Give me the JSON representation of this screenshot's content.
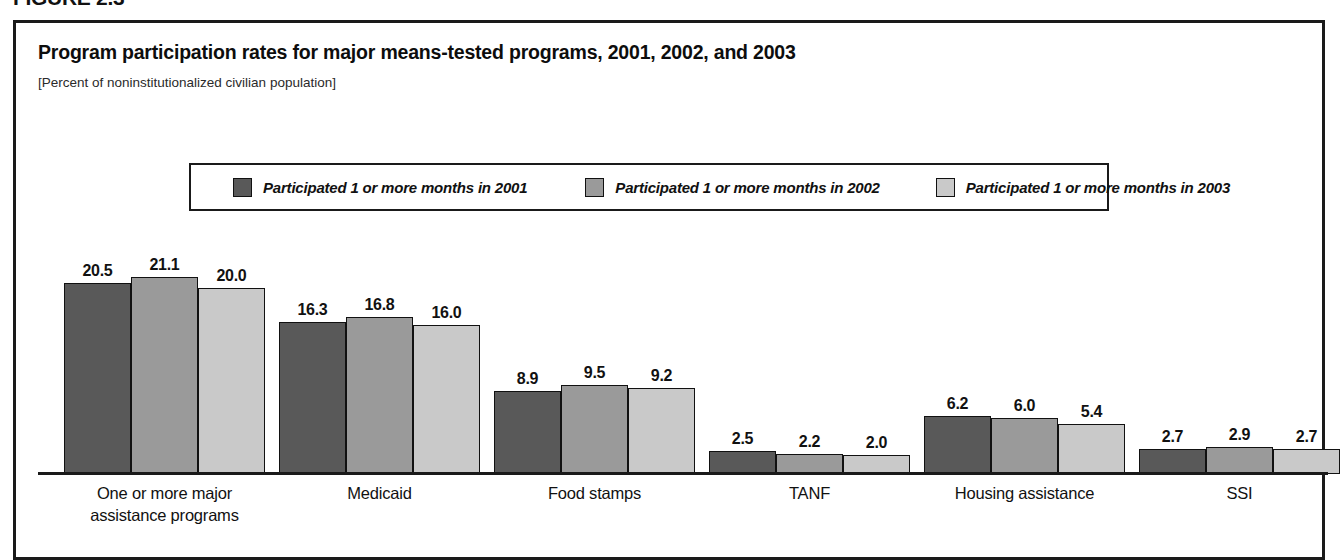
{
  "figure": {
    "label": "FIGURE 2.3",
    "title": "Program participation rates for major means-tested programs, 2001, 2002, and 2003",
    "subtitle": "[Percent of noninstitutionalized civilian population]"
  },
  "colors": {
    "series_2001": "#595959",
    "series_2002": "#9a9a9a",
    "series_2003": "#c9c9c9",
    "outline": "#111111",
    "frame": "#1a1a1a"
  },
  "legend": {
    "entries": [
      {
        "label": "Participated 1 or more months in 2001",
        "swatch": "#595959"
      },
      {
        "label": "Participated 1 or more months in 2002",
        "swatch": "#9a9a9a"
      },
      {
        "label": "Participated 1 or more months in 2003",
        "swatch": "#c9c9c9"
      }
    ]
  },
  "chart_data": {
    "type": "bar",
    "title": "Program participation rates for major means-tested programs, 2001, 2002, and 2003",
    "subtitle": "[Percent of noninstitutionalized civilian population]",
    "xlabel": "",
    "ylabel": "Percent of noninstitutionalized civilian population",
    "ylim": [
      0,
      22
    ],
    "grid": false,
    "legend_position": "top-center",
    "categories": [
      "One or more major assistance programs",
      "Medicaid",
      "Food stamps",
      "TANF",
      "Housing assistance",
      "SSI"
    ],
    "category_lines": [
      [
        "One or more major",
        "assistance programs"
      ],
      [
        "Medicaid"
      ],
      [
        "Food stamps"
      ],
      [
        "TANF"
      ],
      [
        "Housing assistance"
      ],
      [
        "SSI"
      ]
    ],
    "series": [
      {
        "name": "Participated 1 or more months in 2001",
        "color": "#595959",
        "values": [
          20.5,
          16.3,
          8.9,
          2.5,
          6.2,
          2.7
        ],
        "labels": [
          "20.5",
          "16.3",
          "8.9",
          "2.5",
          "6.2",
          "2.7"
        ]
      },
      {
        "name": "Participated 1 or more months in 2002",
        "color": "#9a9a9a",
        "values": [
          21.1,
          16.8,
          9.5,
          2.2,
          6.0,
          2.9
        ],
        "labels": [
          "21.1",
          "16.8",
          "9.5",
          "2.2",
          "6.0",
          "2.9"
        ]
      },
      {
        "name": "Participated 1 or more months in 2003",
        "color": "#c9c9c9",
        "values": [
          20.0,
          16.0,
          9.2,
          2.0,
          5.4,
          2.7
        ],
        "labels": [
          "20.0",
          "16.0",
          "9.2",
          "2.0",
          "5.4",
          "2.7"
        ]
      }
    ]
  }
}
